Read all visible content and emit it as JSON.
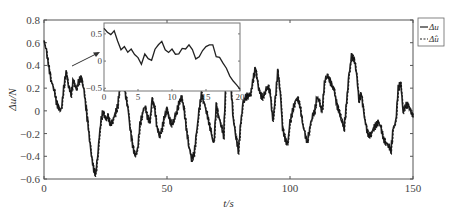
{
  "chart_data": {
    "type": "line",
    "title": "",
    "xlabel": "t/s",
    "ylabel": "Δu/N",
    "xlim": [
      0,
      150
    ],
    "ylim": [
      -0.6,
      0.8
    ],
    "xticks": [
      0,
      50,
      100,
      150
    ],
    "xtick_labels": [
      "0",
      "50",
      "100",
      "150"
    ],
    "yticks": [
      0.8,
      0.6,
      0.4,
      0.2,
      0,
      -0.2,
      -0.4,
      -0.6
    ],
    "ytick_labels": [
      "0.8",
      "0.6",
      "0.4",
      "0.2",
      "0",
      "−0.2",
      "−0.4",
      "−0.6"
    ],
    "grid": false,
    "legend": {
      "position": "upper right",
      "entries": [
        "Δu",
        "Δ̂u"
      ]
    },
    "series": [
      {
        "name": "Δu",
        "style": "solid",
        "x": [
          0,
          1,
          2,
          3,
          4,
          5,
          6,
          7,
          8,
          9,
          10,
          11,
          12,
          13,
          14,
          15,
          16,
          17,
          18,
          19,
          20,
          21,
          22,
          23,
          24,
          25,
          26,
          27,
          28,
          29,
          30,
          31,
          32,
          33,
          34,
          35,
          36,
          37,
          38,
          39,
          40,
          41,
          42,
          43,
          44,
          45,
          46,
          47,
          48,
          49,
          50,
          51,
          52,
          53,
          54,
          55,
          56,
          57,
          58,
          59,
          60,
          61,
          62,
          63,
          64,
          65,
          66,
          67,
          68,
          69,
          70,
          71,
          72,
          73,
          74,
          75,
          76,
          77,
          78,
          79,
          80,
          81,
          82,
          83,
          84,
          85,
          86,
          87,
          88,
          89,
          90,
          91,
          92,
          93,
          94,
          95,
          96,
          97,
          98,
          99,
          100,
          101,
          102,
          103,
          104,
          105,
          106,
          107,
          108,
          109,
          110,
          111,
          112,
          113,
          114,
          115,
          116,
          117,
          118,
          119,
          120,
          121,
          122,
          123,
          124,
          125,
          126,
          127,
          128,
          129,
          130,
          131,
          132,
          133,
          134,
          135,
          136,
          137,
          138,
          139,
          140,
          141,
          142,
          143,
          144,
          145,
          146,
          147,
          148,
          149,
          150
        ],
        "values": [
          0.62,
          0.52,
          0.38,
          0.26,
          0.2,
          0.08,
          0.02,
          0.0,
          0.2,
          0.35,
          0.22,
          0.15,
          0.28,
          0.18,
          0.25,
          0.3,
          0.22,
          0.05,
          -0.15,
          -0.35,
          -0.5,
          -0.56,
          -0.35,
          -0.1,
          0.0,
          -0.08,
          -0.05,
          -0.12,
          -0.08,
          -0.02,
          0.05,
          0.25,
          0.35,
          0.15,
          0.05,
          -0.15,
          -0.3,
          -0.4,
          -0.35,
          -0.12,
          -0.02,
          0.05,
          -0.05,
          -0.1,
          0.1,
          0.02,
          -0.15,
          -0.22,
          -0.15,
          -0.05,
          0.02,
          -0.08,
          -0.12,
          -0.06,
          0.0,
          0.08,
          0.12,
          0.0,
          -0.18,
          -0.32,
          -0.42,
          -0.38,
          -0.2,
          0.0,
          0.15,
          0.08,
          0.0,
          -0.1,
          -0.2,
          -0.3,
          0.05,
          -0.05,
          -0.12,
          -0.22,
          0.28,
          0.38,
          0.2,
          -0.08,
          -0.22,
          -0.35,
          -0.1,
          0.08,
          0.12,
          0.14,
          0.15,
          0.28,
          0.38,
          0.22,
          0.14,
          0.12,
          0.18,
          0.22,
          0.15,
          -0.1,
          0.1,
          0.35,
          0.18,
          -0.15,
          -0.25,
          -0.3,
          -0.1,
          0.0,
          0.08,
          0.12,
          0.05,
          -0.1,
          -0.2,
          -0.28,
          -0.15,
          -0.05,
          0.0,
          0.12,
          0.08,
          -0.02,
          0.25,
          0.32,
          0.28,
          0.22,
          0.18,
          0.05,
          0.0,
          -0.08,
          -0.15,
          0.08,
          0.32,
          0.48,
          0.46,
          0.35,
          0.1,
          0.15,
          -0.02,
          -0.15,
          -0.22,
          -0.2,
          -0.15,
          -0.12,
          -0.1,
          -0.15,
          -0.25,
          -0.28,
          -0.3,
          -0.35,
          -0.15,
          -0.1,
          0.2,
          0.25,
          0.0,
          0.05,
          0.05,
          0.0,
          -0.05
        ]
      },
      {
        "name": "Δ̂u",
        "style": "dashed",
        "note": "estimate closely overlaps Δu"
      }
    ],
    "inset": {
      "xlim": [
        0,
        20
      ],
      "ylim": [
        -0.55,
        0.7
      ],
      "xticks": [
        0,
        5,
        10,
        15,
        20
      ],
      "yticks": [
        0.5,
        0,
        -0.5
      ],
      "ytick_labels": [
        "0.5",
        "0",
        "−0.5"
      ],
      "x": [
        0,
        0.5,
        1,
        1.5,
        2,
        2.5,
        3,
        3.5,
        4,
        4.5,
        5,
        5.5,
        6,
        6.5,
        7,
        7.5,
        8,
        8.5,
        9,
        9.5,
        10,
        10.5,
        11,
        11.5,
        12,
        12.5,
        13,
        13.5,
        14,
        14.5,
        15,
        15.5,
        16,
        16.5,
        17,
        17.5,
        18,
        18.5,
        19,
        19.5,
        20
      ],
      "values": [
        0.6,
        0.55,
        0.5,
        0.55,
        0.35,
        0.2,
        0.28,
        0.18,
        0.22,
        0.1,
        0.05,
        -0.05,
        0.15,
        0.05,
        0.0,
        0.2,
        0.3,
        0.38,
        0.22,
        0.15,
        0.2,
        0.12,
        0.15,
        0.25,
        0.22,
        0.28,
        0.2,
        0.05,
        0.1,
        0.2,
        0.25,
        0.28,
        0.3,
        0.1,
        0.08,
        -0.05,
        -0.15,
        -0.28,
        -0.35,
        -0.42,
        -0.52
      ]
    }
  },
  "annotations": {
    "arrow": "points from main plot toward zoomed inset"
  }
}
